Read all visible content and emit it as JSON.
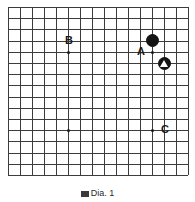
{
  "figure": {
    "caption": "Dia. 1",
    "caption_icon": "square-icon",
    "background_color": "#ffffff",
    "line_color": "#3b3b3b",
    "stone_black_color": "#141414",
    "stone_white_color": "#ffffff"
  },
  "board": {
    "type": "go-board-partial",
    "columns": 16,
    "rows": 16,
    "origin_x": 8,
    "origin_y": 7,
    "spacing_x": 12,
    "spacing_y": 11.2
  },
  "hoshi_points": [
    {
      "name": "hoshi-upper-left",
      "col": 5,
      "row": 4
    },
    {
      "name": "hoshi-lower-left",
      "col": 5,
      "row": 11
    },
    {
      "name": "hoshi-lower-right",
      "col": 12,
      "row": 11
    },
    {
      "name": "hoshi-upper-right",
      "col": 12,
      "row": 4
    }
  ],
  "stones": [
    {
      "name": "black-stone-upper-right",
      "color": "black",
      "col": 12,
      "row": 3,
      "marker": "none"
    },
    {
      "name": "black-stone-marked-triangle",
      "color": "black",
      "col": 13,
      "row": 5,
      "marker": "triangle"
    }
  ],
  "labels": [
    {
      "name": "label-B",
      "text": "B",
      "col": 5,
      "row": 3
    },
    {
      "name": "label-A",
      "text": "A",
      "col": 11,
      "row": 4
    },
    {
      "name": "label-C",
      "text": "C",
      "col": 13,
      "row": 11
    }
  ]
}
